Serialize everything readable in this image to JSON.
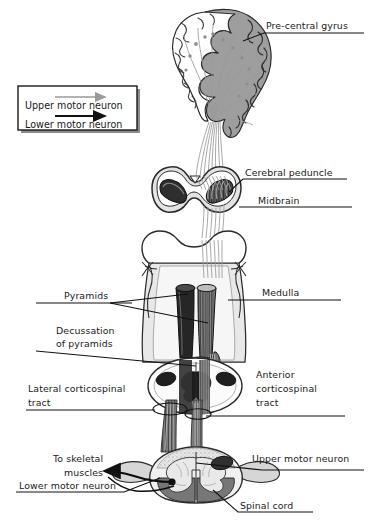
{
  "figure": {
    "background_color": "#ffffff",
    "width": 370,
    "height": 531
  },
  "legend": {
    "name": "motor-neuron-legend",
    "box_color": "#ffffff",
    "border_color": "#1a1a1a",
    "entries": [
      {
        "label": "Upper motor neuron",
        "arrow_color": "#9a9a9a"
      },
      {
        "label": "Lower motor neuron",
        "arrow_color": "#111111"
      }
    ]
  },
  "labels": {
    "pre_central_gyrus": "Pre-central gyrus",
    "cerebral_peduncle": "Cerebral peduncle",
    "midbrain": "Midbrain",
    "medulla": "Medulla",
    "pyramids": "Pyramids",
    "decussation_line1": "Decussation",
    "decussation_line2": "of pyramids",
    "lateral_tract_line1": "Lateral corticospinal",
    "lateral_tract_line2": "tract",
    "anterior_tract_line1": "Anterior",
    "anterior_tract_line2": "corticospinal",
    "anterior_tract_line3": "tract",
    "to_skeletal_line1": "To skeletal",
    "to_skeletal_line2": "muscles",
    "upper_motor_neuron": "Upper motor neuron",
    "lower_motor_neuron": "Lower motor neuron",
    "spinal_cord": "Spinal cord"
  },
  "colors": {
    "outline": "#2a2a2a",
    "cortex_gray": "#9e9e9e",
    "cortex_light": "#d8d8d8",
    "white_matter": "#f2f2f2",
    "peduncle_dark": "#2e2e2e",
    "pyramid_dark": "#262626",
    "pyramid_striated": "#6e6e6e",
    "brainstem_fill": "#ededed",
    "cord_gray_matter": "#7a7a7a",
    "cord_white": "#efefef",
    "fiber_gray": "#9a9a9a",
    "arrow_black": "#111111",
    "text": "#1a1a1a"
  }
}
